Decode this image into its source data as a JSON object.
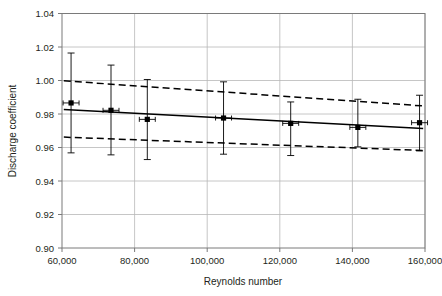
{
  "chart_data": {
    "type": "scatter",
    "title": "",
    "xlabel": "Reynolds number",
    "ylabel": "Discharge coefficient",
    "xlim": [
      60000,
      160000
    ],
    "ylim": [
      0.9,
      1.04
    ],
    "grid": true,
    "legend": "none",
    "xticks": [
      60000,
      80000,
      100000,
      120000,
      140000,
      160000
    ],
    "xtick_labels": [
      "60,000",
      "80,000",
      "100,000",
      "120,000",
      "140,000",
      "160,000"
    ],
    "yticks": [
      0.9,
      0.92,
      0.94,
      0.96,
      0.98,
      1.0,
      1.02,
      1.04
    ],
    "ytick_labels": [
      "0.90",
      "0.92",
      "0.94",
      "0.96",
      "0.98",
      "1.00",
      "1.02",
      "1.04"
    ],
    "series": [
      {
        "name": "Measured discharge coefficient",
        "style": "markers-with-error-bars",
        "marker": "filled-square",
        "color": "#000000",
        "x": [
          62500,
          73500,
          83500,
          104500,
          123000,
          141500,
          158500
        ],
        "y": [
          0.9866,
          0.9822,
          0.9768,
          0.9776,
          0.9744,
          0.972,
          0.9748
        ],
        "yerr_lower": [
          0.9568,
          0.9556,
          0.9528,
          0.956,
          0.9552,
          0.9604,
          0.958
        ],
        "yerr_upper": [
          1.0164,
          1.0092,
          1.0006,
          0.9992,
          0.9872,
          0.9888,
          0.9912
        ],
        "xerr": [
          2200,
          2200,
          2200,
          2200,
          2200,
          2200,
          2200
        ]
      },
      {
        "name": "Best-fit regression line",
        "style": "solid-line",
        "color": "#000000",
        "x": [
          60500,
          159500
        ],
        "y": [
          0.9827,
          0.9713
        ]
      },
      {
        "name": "Upper confidence limit",
        "style": "dashed-line",
        "color": "#000000",
        "x": [
          60500,
          159500
        ],
        "y": [
          0.9998,
          0.9848
        ]
      },
      {
        "name": "Lower confidence limit",
        "style": "dashed-line",
        "color": "#000000",
        "x": [
          60500,
          159500
        ],
        "y": [
          0.9662,
          0.9582
        ]
      }
    ]
  },
  "axes": {
    "x_title": "Reynolds number",
    "y_title": "Discharge coefficient"
  },
  "colors": {
    "frame": "#7a7a7a",
    "grid": "#b8b8b8",
    "data": "#000000",
    "text": "#231f20",
    "background": "#ffffff"
  }
}
